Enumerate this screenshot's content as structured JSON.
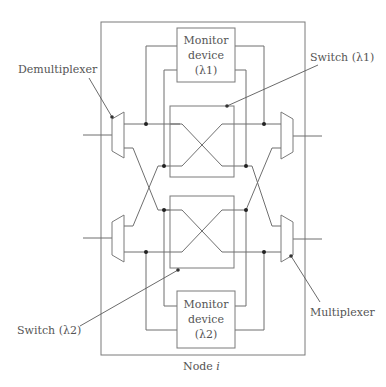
{
  "diagram": {
    "node_label": "Node i",
    "node_label_parts": {
      "prefix": "Node ",
      "var": "i"
    },
    "labels": {
      "demultiplexer": "Demultiplexer",
      "multiplexer": "Multiplexer",
      "switch_1": "Switch (λ1)",
      "switch_2": "Switch (λ2)"
    },
    "monitor_top": {
      "line1": "Monitor",
      "line2": "device",
      "line3": "(λ1)"
    },
    "monitor_bottom": {
      "line1": "Monitor",
      "line2": "device",
      "line3": "(λ2)"
    },
    "colors": {
      "line": "#6f6f6f",
      "text": "#555555",
      "dot": "#222222"
    }
  }
}
